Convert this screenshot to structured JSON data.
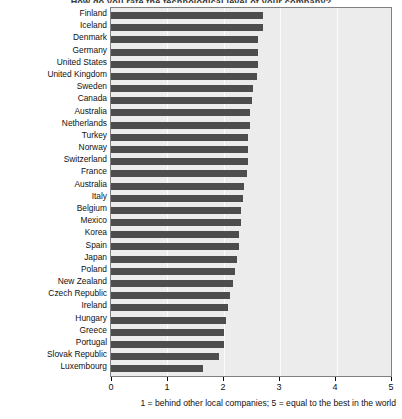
{
  "chart": {
    "title": "How do you rate the technological level of your company?",
    "axis_caption": "1 = behind other local companies; 5 = equal to the best in the world",
    "bar_color": "#4d4d4d",
    "plot_background": "#ececec",
    "frame_color": "#808080"
  },
  "chart_data": {
    "type": "bar",
    "orientation": "horizontal",
    "title": "How do you rate the technological level of your company?",
    "xlabel": "1 = behind other local companies; 5 = equal to the best in the world",
    "ylabel": "",
    "xlim": [
      0,
      5
    ],
    "xticks": [
      0,
      1,
      2,
      3,
      4,
      5
    ],
    "xticklabels": [
      "0",
      "1",
      "2",
      "3",
      "4",
      "5"
    ],
    "grid": true,
    "legend": false,
    "categories": [
      "Finland",
      "Iceland",
      "Denmark",
      "Germany",
      "United States",
      "United Kingdom",
      "Sweden",
      "Canada",
      "Australia",
      "Netherlands",
      "Turkey",
      "Norway",
      "Switzerland",
      "France",
      "Australia",
      "Italy",
      "Belgium",
      "Mexico",
      "Korea",
      "Spain",
      "Japan",
      "Poland",
      "New Zealand",
      "Czech Republic",
      "Ireland",
      "Hungary",
      "Greece",
      "Portugal",
      "Slovak Republic",
      "Luxembourg"
    ],
    "values": [
      2.72,
      2.72,
      2.63,
      2.62,
      2.62,
      2.61,
      2.53,
      2.52,
      2.49,
      2.49,
      2.45,
      2.44,
      2.44,
      2.42,
      2.38,
      2.35,
      2.33,
      2.32,
      2.29,
      2.28,
      2.25,
      2.22,
      2.18,
      2.12,
      2.09,
      2.06,
      2.02,
      2.01,
      1.92,
      1.65
    ]
  }
}
